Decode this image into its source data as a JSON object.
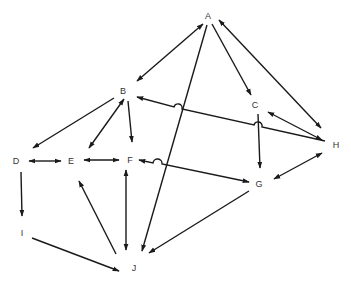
{
  "diagram": {
    "type": "directed-graph",
    "colors": {
      "edge": "#1a1a1a",
      "label": "#333333",
      "background": "#ffffff"
    },
    "nodes": [
      {
        "id": "A",
        "label": "A",
        "x": 208,
        "y": 16
      },
      {
        "id": "B",
        "label": "B",
        "x": 123,
        "y": 91
      },
      {
        "id": "C",
        "label": "C",
        "x": 255,
        "y": 105
      },
      {
        "id": "D",
        "label": "D",
        "x": 16,
        "y": 161
      },
      {
        "id": "E",
        "label": "E",
        "x": 71,
        "y": 161
      },
      {
        "id": "F",
        "label": "F",
        "x": 130,
        "y": 160
      },
      {
        "id": "G",
        "label": "G",
        "x": 259,
        "y": 184
      },
      {
        "id": "H",
        "label": "H",
        "x": 336,
        "y": 145
      },
      {
        "id": "I",
        "label": "I",
        "x": 22,
        "y": 233
      },
      {
        "id": "J",
        "label": "J",
        "x": 134,
        "y": 268
      }
    ],
    "edges": [
      {
        "from": "A",
        "to": "B",
        "direction": "both"
      },
      {
        "from": "A",
        "to": "C",
        "direction": "forward"
      },
      {
        "from": "A",
        "to": "H",
        "direction": "both"
      },
      {
        "from": "A",
        "to": "J",
        "direction": "forward"
      },
      {
        "from": "B",
        "to": "D",
        "direction": "forward"
      },
      {
        "from": "B",
        "to": "E",
        "direction": "both"
      },
      {
        "from": "B",
        "to": "F",
        "direction": "forward"
      },
      {
        "from": "H",
        "to": "B",
        "direction": "forward",
        "hops": [
          "A-J",
          "C-G"
        ]
      },
      {
        "from": "C",
        "to": "G",
        "direction": "forward"
      },
      {
        "from": "C",
        "to": "H",
        "direction": "both"
      },
      {
        "from": "H",
        "to": "G",
        "direction": "both"
      },
      {
        "from": "D",
        "to": "E",
        "direction": "both"
      },
      {
        "from": "E",
        "to": "F",
        "direction": "both"
      },
      {
        "from": "F",
        "to": "G",
        "direction": "both",
        "hops": [
          "A-J"
        ]
      },
      {
        "from": "D",
        "to": "I",
        "direction": "forward"
      },
      {
        "from": "I",
        "to": "J",
        "direction": "forward"
      },
      {
        "from": "J",
        "to": "E",
        "direction": "forward"
      },
      {
        "from": "F",
        "to": "J",
        "direction": "both"
      },
      {
        "from": "G",
        "to": "J",
        "direction": "forward"
      }
    ]
  }
}
